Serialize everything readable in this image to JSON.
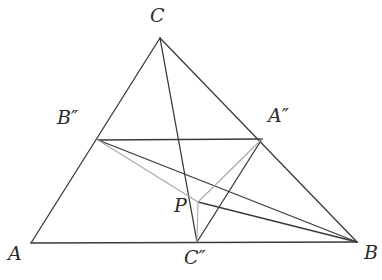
{
  "figure": {
    "kind": "euclidean-geometry-diagram",
    "width": 382,
    "height": 280,
    "background_color": "#ffffff",
    "stroke_color_dark": "#3a3a3a",
    "stroke_color_light": "#a8a8a8"
  },
  "points": {
    "A": {
      "label": "A",
      "x": 31,
      "y": 243,
      "label_x": 8,
      "label_y": 244
    },
    "B": {
      "label": "B",
      "x": 357,
      "y": 242,
      "label_x": 364,
      "label_y": 243
    },
    "C": {
      "label": "C",
      "x": 160,
      "y": 38,
      "label_x": 150,
      "label_y": 6
    },
    "A2": {
      "label": "A″",
      "x": 262,
      "y": 139,
      "label_x": 268,
      "label_y": 106
    },
    "B2": {
      "label": "B″",
      "x": 98,
      "y": 140,
      "label_x": 57,
      "label_y": 108
    },
    "C2": {
      "label": "C″",
      "x": 197,
      "y": 242,
      "label_x": 184,
      "label_y": 248
    },
    "P": {
      "label": "P",
      "x": 198,
      "y": 202,
      "label_x": 174,
      "label_y": 196
    }
  },
  "segments": [
    {
      "name": "side-AB",
      "from": "A",
      "to": "B",
      "color": "#3a3a3a",
      "width": 1.3
    },
    {
      "name": "side-AC",
      "from": "A",
      "to": "C",
      "color": "#3a3a3a",
      "width": 1.3
    },
    {
      "name": "side-CB",
      "from": "C",
      "to": "B",
      "color": "#3a3a3a",
      "width": 1.3
    },
    {
      "name": "segment-B2-A2",
      "from": "B2",
      "to": "A2",
      "color": "#3a3a3a",
      "width": 1.3
    },
    {
      "name": "cevian-C-to-C2",
      "from": "C",
      "to": "C2",
      "color": "#3a3a3a",
      "width": 1.3
    },
    {
      "name": "cevian-A2-to-C2",
      "from": "A2",
      "to": "C2",
      "color": "#3a3a3a",
      "width": 1.3
    },
    {
      "name": "segment-B2-to-B",
      "from": "B2",
      "to": "B",
      "color": "#3a3a3a",
      "width": 1.3
    },
    {
      "name": "segment-P-to-B",
      "from": "P",
      "to": "B",
      "color": "#3a3a3a",
      "width": 1.3
    },
    {
      "name": "segment-B2-to-P",
      "from": "B2",
      "to": "P",
      "color": "#a8a8a8",
      "width": 1.1
    },
    {
      "name": "segment-A2-to-P",
      "from": "A2",
      "to": "P",
      "color": "#a8a8a8",
      "width": 1.1
    },
    {
      "name": "segment-P-to-C2",
      "from": "P",
      "to": "C2",
      "color": "#a8a8a8",
      "width": 1.1
    }
  ]
}
